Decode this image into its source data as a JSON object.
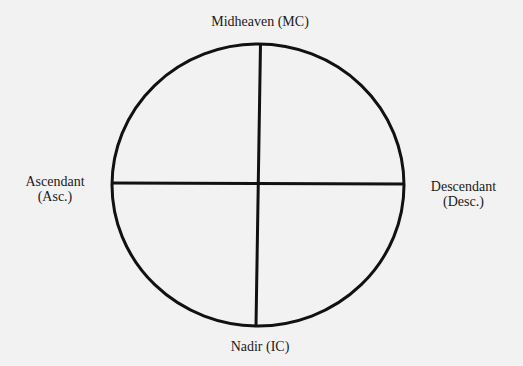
{
  "diagram": {
    "type": "astrological-chart-angles",
    "background_color": "#f2f2f2",
    "line_color": "#111111",
    "circle": {
      "center_x": 258,
      "center_y": 185,
      "radius_x": 146,
      "radius_y": 141
    },
    "labels": {
      "top": {
        "line1": "Midheaven (MC)"
      },
      "left": {
        "line1": "Ascendant",
        "line2": "(Asc.)"
      },
      "right": {
        "line1": "Descendant",
        "line2": "(Desc.)"
      },
      "bottom": {
        "line1": "Nadir (IC)"
      }
    }
  }
}
